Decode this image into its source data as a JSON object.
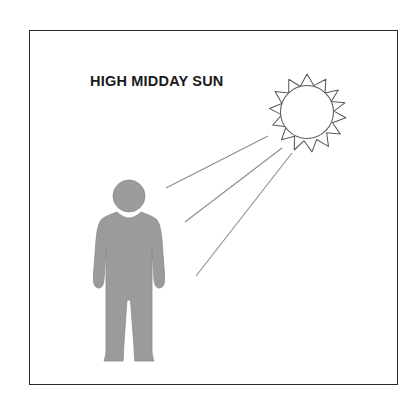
{
  "illustration": {
    "caption": "HIGH MIDDAY SUN",
    "frame": {
      "border_color": "#2b2b2b",
      "background_color": "#ffffff"
    },
    "sun": {
      "name": "sun",
      "outline_color": "#5a5a5a",
      "fill_color": "#ffffff",
      "ray_points": 16,
      "center_x": 307,
      "center_y": 112,
      "inner_radius": 26,
      "outer_radius": 38
    },
    "person": {
      "name": "standing-person-silhouette",
      "fill_color": "#9b9b9b",
      "outline_color": "#8a8a8a",
      "head_center_x": 129,
      "head_center_y": 196,
      "head_radius": 16
    },
    "sunbeams": {
      "name": "sun-rays-to-person",
      "stroke_color": "#8d8d8d",
      "count": 3,
      "lines": [
        {
          "x1": 268,
          "y1": 136,
          "x2": 166,
          "y2": 188
        },
        {
          "x1": 282,
          "y1": 148,
          "x2": 185,
          "y2": 222
        },
        {
          "x1": 292,
          "y1": 153,
          "x2": 196,
          "y2": 276
        }
      ]
    }
  }
}
